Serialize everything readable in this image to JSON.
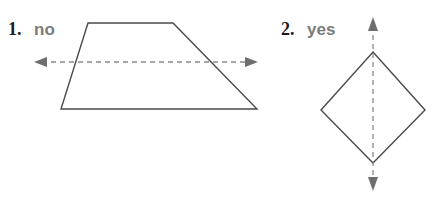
{
  "page": {
    "background_color": "#ffffff",
    "width": 436,
    "height": 202
  },
  "colors": {
    "number_text": "#1b1b1b",
    "answer_text": "#7b7b7b",
    "shape_stroke": "#4a4a4a",
    "axis_stroke": "#8a8a8a",
    "arrowhead": "#6e6e6e"
  },
  "problems": [
    {
      "number": "1.",
      "answer": "no",
      "shape": "trapezoid",
      "symmetry_line": "horizontal",
      "shape_points": "88,23 173,23 257,109 61,109",
      "axis": {
        "orientation": "horizontal",
        "line": {
          "x1": 42,
          "y1": 62,
          "x2": 250,
          "y2": 62
        },
        "head_start": {
          "points": "34,62 47,57 47,67"
        },
        "head_end": {
          "points": "258,62 245,57 245,67"
        }
      }
    },
    {
      "number": "2.",
      "answer": "yes",
      "shape": "rhombus",
      "symmetry_line": "vertical",
      "shape_points": "373,52 425,110 373,163 321,110",
      "axis": {
        "orientation": "vertical",
        "line": {
          "x1": 373,
          "y1": 26,
          "x2": 373,
          "y2": 182
        },
        "head_start": {
          "points": "373,17 368,31 378,31"
        },
        "head_end": {
          "points": "373,191 368,177 378,177"
        }
      }
    }
  ]
}
